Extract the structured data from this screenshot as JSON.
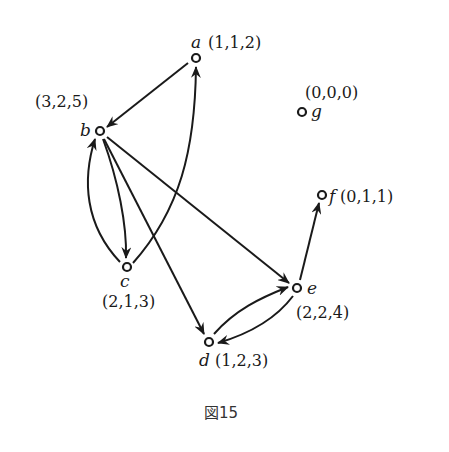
{
  "figure": {
    "caption": "図15",
    "nodes": [
      {
        "id": "a",
        "name": "a",
        "tuple": "(1,1,2)",
        "x": 196,
        "y": 58
      },
      {
        "id": "b",
        "name": "b",
        "tuple": "(3,2,5)",
        "x": 100,
        "y": 131
      },
      {
        "id": "c",
        "name": "c",
        "tuple": "(2,1,3)",
        "x": 127,
        "y": 267
      },
      {
        "id": "d",
        "name": "d",
        "tuple": "(1,2,3)",
        "x": 209,
        "y": 342
      },
      {
        "id": "e",
        "name": "e",
        "tuple": "(2,2,4)",
        "x": 297,
        "y": 288
      },
      {
        "id": "f",
        "name": "f",
        "tuple": "(0,1,1)",
        "x": 322,
        "y": 195
      },
      {
        "id": "g",
        "name": "g",
        "tuple": "(0,0,0)",
        "x": 302,
        "y": 112
      }
    ],
    "edges": [
      {
        "from": "a",
        "to": "b"
      },
      {
        "from": "c",
        "to": "a"
      },
      {
        "from": "c",
        "to": "b"
      },
      {
        "from": "b",
        "to": "c"
      },
      {
        "from": "b",
        "to": "d"
      },
      {
        "from": "b",
        "to": "e"
      },
      {
        "from": "e",
        "to": "f"
      },
      {
        "from": "d",
        "to": "e"
      },
      {
        "from": "e",
        "to": "d"
      }
    ]
  }
}
